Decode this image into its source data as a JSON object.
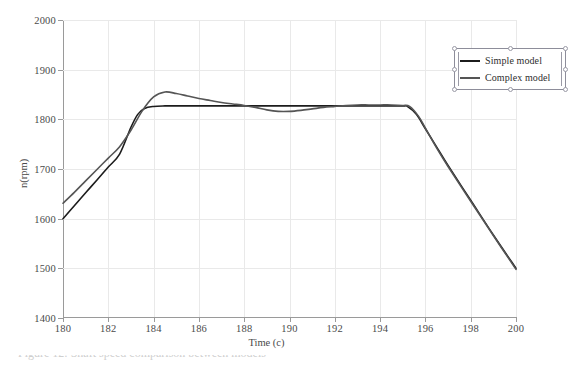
{
  "figure": {
    "background_color": "#ffffff",
    "caption_clipped": "Figure 12: Shaft speed comparison between models"
  },
  "axes": {
    "y": {
      "title": "n(rpm)",
      "ticks": [
        "2000",
        "1900",
        "1800",
        "1700",
        "1600",
        "1500",
        "1400"
      ]
    },
    "x": {
      "title": "Time (c)",
      "ticks": [
        "180",
        "182",
        "184",
        "186",
        "188",
        "190",
        "192",
        "194",
        "196",
        "198",
        "200"
      ]
    },
    "grid_color": "#e9e9e9",
    "axis_color": "#9a9a9a"
  },
  "legend": {
    "position": "top-right",
    "selected": true,
    "entries": [
      {
        "label": "Simple model",
        "color": "#1c1c1c"
      },
      {
        "label": "Complex model",
        "color": "#555555"
      }
    ]
  },
  "chart_data": {
    "type": "line",
    "title": "",
    "subtitle": "",
    "xlabel": "Time (c)",
    "ylabel": "n(rpm)",
    "xlim": [
      180,
      200
    ],
    "ylim": [
      1400,
      2000
    ],
    "xticks": [
      180,
      182,
      184,
      186,
      188,
      190,
      192,
      194,
      196,
      198,
      200
    ],
    "yticks": [
      1400,
      1500,
      1600,
      1700,
      1800,
      1900,
      2000
    ],
    "grid": true,
    "legend_position": "upper right",
    "series": [
      {
        "name": "Simple model",
        "color": "#1c1c1c",
        "linewidth": 1.6,
        "x": [
          180,
          180.5,
          181,
          181.5,
          182,
          182.5,
          183,
          183.3,
          183.6,
          184,
          184.5,
          185,
          186,
          187,
          188,
          189,
          190,
          191,
          192,
          193,
          194,
          195,
          195.2,
          195.6,
          196,
          196.5,
          197,
          198,
          199,
          200
        ],
        "y": [
          1600,
          1626,
          1652,
          1678,
          1704,
          1730,
          1784,
          1810,
          1822,
          1826,
          1827,
          1827,
          1827,
          1827,
          1827,
          1827,
          1827,
          1827,
          1827,
          1827,
          1827,
          1827,
          1826,
          1810,
          1781,
          1744,
          1707,
          1637,
          1567,
          1500
        ]
      },
      {
        "name": "Complex model",
        "color": "#555555",
        "linewidth": 1.6,
        "x": [
          180,
          180.5,
          181,
          181.5,
          182,
          182.5,
          183,
          183.5,
          184,
          184.5,
          185,
          185.5,
          186,
          186.5,
          187,
          187.5,
          188,
          188.5,
          189,
          189.5,
          190,
          190.5,
          191,
          191.5,
          192,
          192.5,
          193,
          193.5,
          194,
          194.5,
          195,
          195.3,
          195.7,
          196,
          196.5,
          197,
          198,
          199,
          200
        ],
        "y": [
          1631,
          1653,
          1676,
          1699,
          1722,
          1745,
          1778,
          1817,
          1845,
          1855,
          1852,
          1847,
          1842,
          1838,
          1834,
          1831,
          1828,
          1824,
          1819,
          1816,
          1816,
          1818,
          1821,
          1824,
          1826,
          1828,
          1829,
          1829,
          1829,
          1829,
          1828,
          1826,
          1806,
          1782,
          1742,
          1705,
          1635,
          1566,
          1498
        ]
      }
    ]
  }
}
